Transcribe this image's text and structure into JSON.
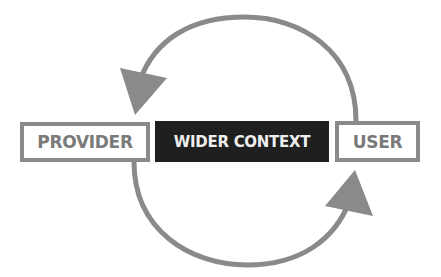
{
  "diagram": {
    "nodes": [
      {
        "id": "provider",
        "label": "PROVIDER"
      },
      {
        "id": "wider_context",
        "label": "WIDER CONTEXT"
      },
      {
        "id": "user",
        "label": "USER"
      }
    ],
    "edges": [
      {
        "from": "user",
        "to": "provider",
        "path": "top-arc"
      },
      {
        "from": "provider",
        "to": "user",
        "path": "bottom-arc"
      }
    ],
    "colors": {
      "arrow": "#8a8a8a",
      "outline": "#8a8a8a",
      "dark_fill": "#1f1f1f",
      "outline_text": "#7a7a7a",
      "dark_text": "#eeeeee"
    }
  }
}
